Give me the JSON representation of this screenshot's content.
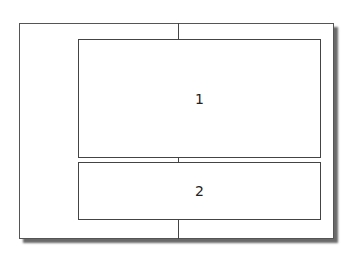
{
  "diagram": {
    "type": "layout-split",
    "frame": {
      "left": 19,
      "top": 23,
      "width": 315,
      "height": 216
    },
    "center_line_x": 178,
    "boxes": [
      {
        "id": "1",
        "label": "1",
        "left": 78,
        "top": 39,
        "width": 243,
        "height": 119
      },
      {
        "id": "2",
        "label": "2",
        "left": 78,
        "top": 162,
        "width": 243,
        "height": 58
      }
    ]
  }
}
